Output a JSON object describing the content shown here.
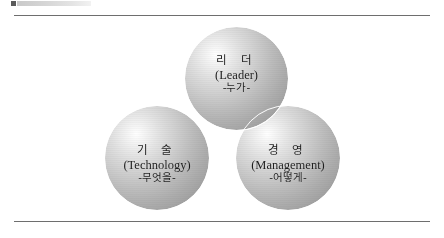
{
  "page": {
    "background_color": "#ffffff",
    "rule_color": "#6e6e6e"
  },
  "header": {
    "artifact_label": "",
    "swatch_color": "#5a5a5a",
    "bar_color": "#d6d6d6"
  },
  "diagram": {
    "type": "venn",
    "title": "",
    "sphere_fill": "#bcbcbc",
    "outline_color": "#ffffff",
    "text_color": "#1d1d1d",
    "circles": [
      {
        "id": "leader",
        "position": "top",
        "korean": "리 더",
        "english": "(Leader)",
        "question": "-누가-",
        "center": [
          236,
          78
        ],
        "radius": 52
      },
      {
        "id": "technology",
        "position": "bottom-left",
        "korean": "기 술",
        "english": "(Technology)",
        "question": "-무엇을-",
        "center": [
          157,
          158
        ],
        "radius": 53
      },
      {
        "id": "management",
        "position": "bottom-right",
        "korean": "경 영",
        "english": "(Management)",
        "question": "-어떻게-",
        "center": [
          288,
          158
        ],
        "radius": 53
      }
    ]
  }
}
